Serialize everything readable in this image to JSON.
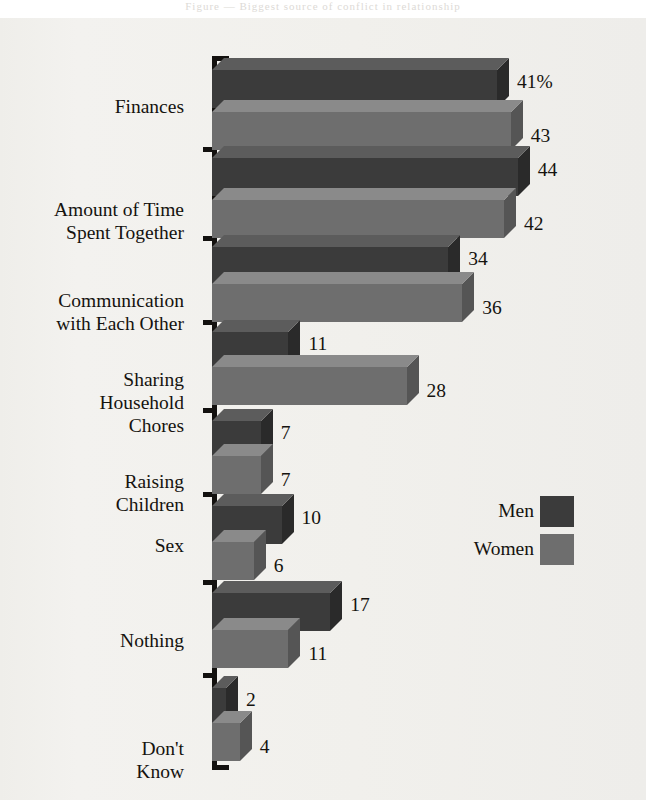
{
  "page": {
    "background": "#f2f1ee",
    "header_ghost_text": "Figure — Biggest source of conflict in relationship"
  },
  "legend": {
    "title": "",
    "position": "middle-right",
    "entries": [
      {
        "label": "Men",
        "color": "#3b3b3b"
      },
      {
        "label": "Women",
        "color": "#6e6e6e"
      }
    ]
  },
  "colors": {
    "men_front": "#3b3b3b",
    "men_top": "#5c5c5c",
    "men_side": "#2a2a2a",
    "women_front": "#6e6e6e",
    "women_top": "#8a8a8a",
    "women_side": "#555555",
    "axis": "#13110f",
    "text": "#15130f",
    "background": "#f2f1ee"
  },
  "chart_data": {
    "type": "bar",
    "orientation": "horizontal",
    "style": "3d-grouped",
    "title": "",
    "subtitle": "",
    "xlabel": "",
    "ylabel": "",
    "xlim": [
      0,
      46
    ],
    "grid": false,
    "legend_position": "middle-right",
    "value_suffix_first": "%",
    "categories": [
      "Finances",
      "Amount of Time\nSpent Together",
      "Communication\nwith Each Other",
      "Sharing\nHousehold\nChores",
      "Raising\nChildren",
      "Sex",
      "Nothing",
      "Don't\nKnow"
    ],
    "series": [
      {
        "name": "Men",
        "values": [
          41,
          44,
          34,
          11,
          7,
          10,
          17,
          2
        ]
      },
      {
        "name": "Women",
        "values": [
          43,
          42,
          36,
          28,
          7,
          6,
          11,
          4
        ]
      }
    ],
    "value_labels": {
      "Men": [
        "41%",
        "44",
        "34",
        "11",
        "7",
        "10",
        "17",
        "2"
      ],
      "Women": [
        "43",
        "42",
        "36",
        "28",
        "7",
        "6",
        "11",
        "4"
      ]
    }
  },
  "layout": {
    "axis_x": 212,
    "axis_top": 56,
    "axis_bottom": 770,
    "px_per_unit": 6.95,
    "bar_height": 38,
    "depth": 12,
    "groups": [
      {
        "label_y": 95,
        "tick_y": 56,
        "men_y": 58,
        "women_y": 100
      },
      {
        "label_y": 198,
        "tick_y": 147,
        "men_y": 146,
        "women_y": 188
      },
      {
        "label_y": 289,
        "tick_y": 236,
        "men_y": 235,
        "women_y": 272
      },
      {
        "label_y": 368,
        "tick_y": 320,
        "men_y": 320,
        "women_y": 355
      },
      {
        "label_y": 470,
        "tick_y": 408,
        "men_y": 409,
        "women_y": 444
      },
      {
        "label_y": 534,
        "tick_y": 492,
        "men_y": 494,
        "women_y": 530
      },
      {
        "label_y": 629,
        "tick_y": 580,
        "men_y": 581,
        "women_y": 618
      },
      {
        "label_y": 737,
        "tick_y": 673,
        "men_y": 676,
        "women_y": 711
      }
    ]
  }
}
